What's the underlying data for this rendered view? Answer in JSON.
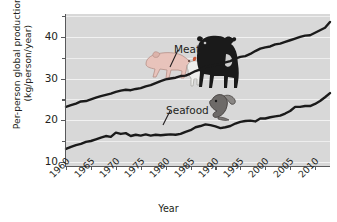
{
  "chart_data": {
    "type": "line",
    "title": "",
    "xlabel": "Year",
    "ylabel": "Per-person global production (kg/person/year)",
    "ylabel_line1": "Per-person global production",
    "ylabel_line2": "(kg/person/year)",
    "xlim": [
      1960,
      2013
    ],
    "ylim": [
      9.0,
      45.5
    ],
    "yticks": [
      10,
      20,
      30,
      40
    ],
    "yticks_minor": [
      15,
      25,
      35,
      45
    ],
    "xticks": [
      1960,
      1965,
      1970,
      1975,
      1980,
      1985,
      1990,
      1995,
      2000,
      2005,
      2010
    ],
    "xtick_labels": [
      "1960",
      "1965",
      "1970",
      "1975",
      "1980",
      "1985",
      "1990",
      "1995",
      "2000",
      "2005",
      "2010"
    ],
    "ytick_labels": [
      "10",
      "20",
      "30",
      "40"
    ],
    "grid": true,
    "legend": "inline-annotations",
    "plot_bgcolor": "#d8d8d8",
    "line_color": "#1a1a1a",
    "x": [
      1960,
      1961,
      1962,
      1963,
      1964,
      1965,
      1966,
      1967,
      1968,
      1969,
      1970,
      1971,
      1972,
      1973,
      1974,
      1975,
      1976,
      1977,
      1978,
      1979,
      1980,
      1981,
      1982,
      1983,
      1984,
      1985,
      1986,
      1987,
      1988,
      1989,
      1990,
      1991,
      1992,
      1993,
      1994,
      1995,
      1996,
      1997,
      1998,
      1999,
      2000,
      2001,
      2002,
      2003,
      2004,
      2005,
      2006,
      2007,
      2008,
      2009,
      2010,
      2011,
      2012,
      2013
    ],
    "series": [
      {
        "name": "Meat",
        "values": [
          23.2,
          23.6,
          24.0,
          24.5,
          24.6,
          25.0,
          25.4,
          25.8,
          26.1,
          26.4,
          26.8,
          27.1,
          27.3,
          27.2,
          27.5,
          27.7,
          28.1,
          28.4,
          28.9,
          29.4,
          29.8,
          30.0,
          30.2,
          30.6,
          30.7,
          31.2,
          31.8,
          32.2,
          32.8,
          33.0,
          33.3,
          33.5,
          33.9,
          34.2,
          34.8,
          35.2,
          35.4,
          35.9,
          36.6,
          37.2,
          37.5,
          37.7,
          38.2,
          38.4,
          38.8,
          39.2,
          39.6,
          40.0,
          40.3,
          40.4,
          41.0,
          41.6,
          42.2,
          43.6
        ]
      },
      {
        "name": "Seafood",
        "values": [
          13.1,
          13.6,
          14.0,
          14.3,
          14.8,
          15.0,
          15.4,
          15.8,
          16.2,
          16.0,
          17.0,
          16.7,
          16.9,
          16.2,
          16.5,
          16.3,
          16.6,
          16.3,
          16.5,
          16.4,
          16.5,
          16.6,
          16.5,
          16.7,
          17.2,
          17.6,
          18.3,
          18.6,
          19.0,
          18.8,
          18.5,
          18.1,
          18.3,
          18.6,
          19.2,
          19.6,
          19.8,
          19.9,
          19.7,
          20.4,
          20.4,
          20.7,
          20.9,
          21.1,
          21.6,
          22.2,
          23.2,
          23.2,
          23.4,
          23.4,
          23.9,
          24.6,
          25.5,
          26.5
        ]
      }
    ],
    "annotations": [
      {
        "name": "meat-annotation",
        "text": "Meat",
        "x_pos": 1988,
        "y_pos": 41.0
      },
      {
        "name": "seafood-annotation",
        "text": "Seafood",
        "x_pos": 1985,
        "y_pos": 26.5
      }
    ],
    "illustrations": [
      {
        "name": "pig-illustration",
        "subject": "pig"
      },
      {
        "name": "cow-illustration",
        "subject": "cow"
      },
      {
        "name": "chicken-illustration",
        "subject": "chicken"
      },
      {
        "name": "fish-illustration",
        "subject": "fish"
      }
    ]
  }
}
